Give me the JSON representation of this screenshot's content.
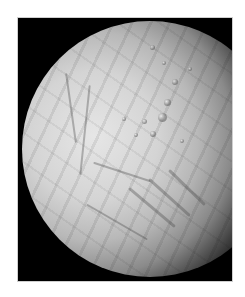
{
  "image": {
    "subject": "Icy moon (Enceladus-like) with cratered northern terrain and fractured southern region, lit from the left, terminator on the right",
    "background_color": "#000000",
    "page_color": "#ffffff",
    "surface_color_bright": "#e6e6e6",
    "surface_color_mid": "#b8b8b8",
    "shadow_color": "#000000"
  }
}
